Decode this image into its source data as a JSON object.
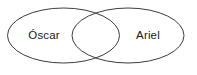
{
  "figure": {
    "type": "venn-diagram",
    "background_color": "#ffffff",
    "width": 197,
    "height": 75
  },
  "diagram": {
    "stroke_color": "#3c3c3c",
    "stroke_width": 1,
    "fill_color": "none",
    "sets": [
      {
        "id": "left",
        "label": "Óscar",
        "cx": 63.5,
        "cy": 35.5,
        "rx": 56,
        "ry": 27.5,
        "label_x": 44,
        "label_y": 36
      },
      {
        "id": "right",
        "label": "Ariel",
        "cx": 128,
        "cy": 35.5,
        "rx": 56,
        "ry": 27.5,
        "label_x": 148,
        "label_y": 36
      }
    ],
    "intersection": {
      "label": "",
      "cx": 95.75,
      "cy": 35.5
    }
  }
}
